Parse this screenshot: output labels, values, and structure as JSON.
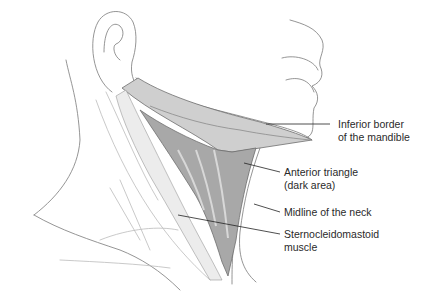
{
  "figure": {
    "colors": {
      "line": "#6e6e6e",
      "leader": "#222222",
      "muscle_dark": "#9a9a9a",
      "muscle_mid": "#c4c4c4",
      "muscle_light": "#e2e2e2",
      "background": "#ffffff"
    }
  },
  "labels": [
    {
      "id": "inferior-border-mandible",
      "lines": [
        "Inferior border",
        "of the mandible"
      ]
    },
    {
      "id": "anterior-triangle",
      "lines": [
        "Anterior triangle",
        "(dark area)"
      ]
    },
    {
      "id": "midline-neck",
      "lines": [
        "Midline of the neck"
      ]
    },
    {
      "id": "sternocleidomastoid",
      "lines": [
        "Sternocleidomastoid",
        "muscle"
      ]
    }
  ]
}
